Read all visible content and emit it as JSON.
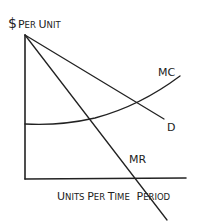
{
  "diagram": {
    "type": "economics-monopoly-cost-revenue",
    "y_axis": {
      "symbol": "$",
      "label_first": "P",
      "label_rest": "ER ",
      "label_word2_first": "U",
      "label_word2_rest": "NIT",
      "full_label": "$ PER UNIT"
    },
    "x_axis": {
      "full_label": "UNITS PER TIME PERIOD",
      "parts": [
        {
          "first": "U",
          "rest": "NITS "
        },
        {
          "first": "P",
          "rest": "ER "
        },
        {
          "first": "T",
          "rest": "IME "
        },
        {
          "first": "P",
          "rest": "ERIOD"
        }
      ]
    },
    "curves": [
      {
        "name": "MC",
        "label": "MC",
        "shape": "upward-sloping curve",
        "points": [
          [
            25,
            124
          ],
          [
            90,
            120
          ],
          [
            180,
            76
          ]
        ]
      },
      {
        "name": "D",
        "label": "D",
        "shape": "downward-sloping line",
        "points": [
          [
            25,
            35
          ],
          [
            164,
            119
          ]
        ]
      },
      {
        "name": "MR",
        "label": "MR",
        "shape": "steeper downward-sloping line",
        "points": [
          [
            25,
            35
          ],
          [
            167,
            220
          ]
        ]
      }
    ],
    "colors": {
      "ink": "#222222",
      "background": "#ffffff"
    }
  }
}
